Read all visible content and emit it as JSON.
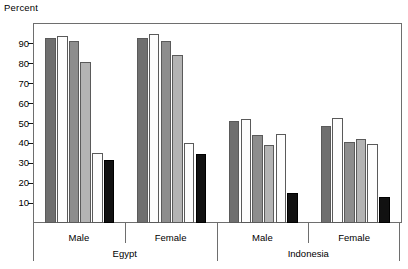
{
  "chart_data": {
    "type": "bar",
    "title": "",
    "subtitle": "",
    "xlabel": "",
    "ylabel": "Percent",
    "ylim": [
      0,
      100
    ],
    "yticks": [
      10,
      20,
      30,
      40,
      50,
      60,
      70,
      80,
      90
    ],
    "ytick_labels": [
      "10",
      "20",
      "30",
      "40",
      "50",
      "60",
      "70",
      "80",
      "90"
    ],
    "grid": false,
    "legend": "none",
    "group_labels": [
      "Male",
      "Female",
      "Male",
      "Female"
    ],
    "super_group_labels": [
      "Egypt",
      "Indonesia"
    ],
    "categories": [
      "Egypt Male",
      "Egypt Female",
      "Indonesia Male",
      "Indonesia Female"
    ],
    "series": [
      {
        "name": "series-1",
        "color": "#6f6f6f",
        "values": [
          93,
          93,
          51.5,
          49
        ]
      },
      {
        "name": "series-2",
        "color": "#fdfdfd",
        "values": [
          94,
          95,
          52.5,
          53
        ]
      },
      {
        "name": "series-3",
        "color": "#8d8d8d",
        "values": [
          91.5,
          91.5,
          44,
          40.5
        ]
      },
      {
        "name": "series-4",
        "color": "#b4b4b4",
        "values": [
          81,
          84.5,
          39,
          42
        ]
      },
      {
        "name": "series-5",
        "color": "#fdfdfd",
        "values": [
          35,
          40,
          44.5,
          39.5
        ]
      },
      {
        "name": "series-6",
        "color": "#111111",
        "values": [
          31.5,
          34.5,
          15,
          13
        ]
      }
    ]
  },
  "axis": {
    "y_title": "Percent"
  },
  "colors": {
    "frame": "#6e6e6e",
    "bar_outline": "#5a5a5a",
    "text": "#000000"
  }
}
